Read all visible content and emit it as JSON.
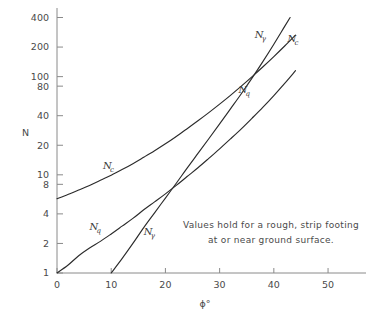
{
  "chart_data": {
    "type": "line",
    "title": "",
    "subtitle": "",
    "xlabel": "ϕ°",
    "ylabel": "N",
    "xlim": [
      0,
      57
    ],
    "ylim": [
      1,
      500
    ],
    "yscale": "log",
    "xscale": "linear",
    "grid": false,
    "legend": "none",
    "x_ticks": [
      0,
      10,
      20,
      30,
      40,
      50
    ],
    "x_tick_labels": [
      "0",
      "10",
      "20",
      "30",
      "40",
      "50"
    ],
    "y_ticks": [
      1,
      2,
      4,
      8,
      10,
      20,
      40,
      80,
      100,
      200,
      400
    ],
    "y_tick_labels": [
      "1",
      "2",
      "4",
      "8",
      "10",
      "20",
      "40",
      "80",
      "100",
      "200",
      "400"
    ],
    "annotations": [
      {
        "name": "footing-note",
        "line1": "Values hold for a rough, strip footing",
        "line2": "at or near ground surface."
      }
    ],
    "series": [
      {
        "name": "Nc",
        "label": "N",
        "subscript": "c",
        "label_positions": [
          {
            "x": 8.5,
            "y": 11.5
          },
          {
            "x": 42.5,
            "y": 225
          }
        ],
        "x": [
          0,
          2,
          4,
          6,
          8,
          10,
          12,
          14,
          16,
          18,
          20,
          22,
          24,
          26,
          28,
          30,
          32,
          34,
          36,
          38,
          40,
          42,
          44
        ],
        "y": [
          5.7,
          6.3,
          7.0,
          7.8,
          8.8,
          9.9,
          11.3,
          13.0,
          15.1,
          17.6,
          20.7,
          24.6,
          29.5,
          35.5,
          43.0,
          52.5,
          64.5,
          80.0,
          100.0,
          126.0,
          160.0,
          205.0,
          265.0
        ]
      },
      {
        "name": "Nq",
        "label": "N",
        "subscript": "q",
        "label_positions": [
          {
            "x": 6.0,
            "y": 2.75
          },
          {
            "x": 33.5,
            "y": 68
          }
        ],
        "x": [
          0,
          2,
          4,
          6,
          8,
          10,
          12,
          14,
          16,
          18,
          20,
          22,
          24,
          26,
          28,
          30,
          32,
          34,
          36,
          38,
          40,
          42,
          44
        ],
        "y": [
          1.0,
          1.2,
          1.5,
          1.8,
          2.1,
          2.5,
          3.0,
          3.6,
          4.4,
          5.3,
          6.4,
          7.8,
          9.6,
          11.8,
          14.7,
          18.4,
          23.2,
          29.4,
          37.8,
          48.9,
          64.2,
          85.4,
          115.0
        ]
      },
      {
        "name": "Ngamma",
        "label": "N",
        "subscript": "γ",
        "label_positions": [
          {
            "x": 16.0,
            "y": 2.45
          },
          {
            "x": 36.5,
            "y": 250
          }
        ],
        "x": [
          10,
          12,
          14,
          16,
          18,
          20,
          22,
          24,
          26,
          28,
          30,
          32,
          34,
          36,
          38,
          40,
          42,
          43
        ],
        "y": [
          1.0,
          1.4,
          2.0,
          2.9,
          4.1,
          5.8,
          8.2,
          11.7,
          16.5,
          23.3,
          33.0,
          47.0,
          67.0,
          97.0,
          143.0,
          214.0,
          325.0,
          400.0
        ]
      }
    ]
  }
}
